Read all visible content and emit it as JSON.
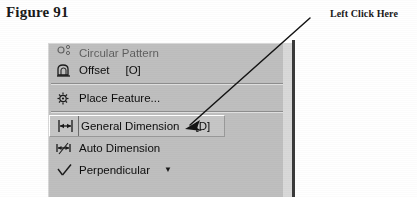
{
  "figure": {
    "label": "Figure 91"
  },
  "annotation": {
    "label": "Left Click Here",
    "arrow_start": "310,18",
    "arrow_end": "186,128"
  },
  "colors": {
    "page_background": "#ffffff",
    "menu_background": "#bfbfbf",
    "menu_selected_background": "#c6c6c6",
    "menu_border_dark": "#3a3a3a",
    "separator": "#8d8d8d",
    "text": "#0d0d0d"
  },
  "context_menu": {
    "items": [
      {
        "label": "Circular Pattern",
        "shortcut": "",
        "icon": "circular-pattern-icon",
        "clipped": true,
        "selected": false,
        "separator_after": false,
        "caret": ""
      },
      {
        "label": "Offset",
        "shortcut": "[O]",
        "icon": "offset-icon",
        "clipped": false,
        "selected": false,
        "separator_after": true,
        "caret": ""
      },
      {
        "label": "Place Feature...",
        "shortcut": "",
        "icon": "place-feature-icon",
        "clipped": false,
        "selected": false,
        "separator_after": true,
        "caret": ""
      },
      {
        "label": "General Dimension",
        "shortcut": "[D]",
        "icon": "general-dimension-icon",
        "clipped": false,
        "selected": true,
        "separator_after": false,
        "caret": ""
      },
      {
        "label": "Auto Dimension",
        "shortcut": "",
        "icon": "auto-dimension-icon",
        "clipped": false,
        "selected": false,
        "separator_after": false,
        "caret": ""
      },
      {
        "label": "Perpendicular",
        "shortcut": "",
        "icon": "perpendicular-icon",
        "clipped": false,
        "selected": false,
        "separator_after": false,
        "caret": "▼"
      }
    ]
  }
}
